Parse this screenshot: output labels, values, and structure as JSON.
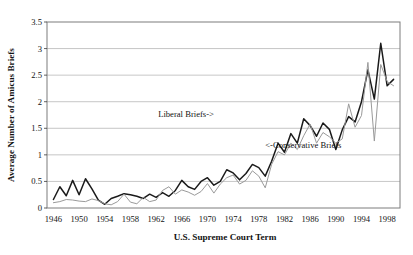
{
  "chart_data": {
    "type": "line",
    "title": "",
    "xlabel": "U.S. Supreme Court Term",
    "ylabel": "Average Number of Amicus Briefs",
    "xlim": [
      1945,
      2000
    ],
    "ylim": [
      0,
      3.5
    ],
    "ytick_labels": [
      "0",
      "0.5",
      "1",
      "1.5",
      "2",
      "2.5",
      "3",
      "3.5"
    ],
    "ytick_values": [
      0,
      0.5,
      1,
      1.5,
      2,
      2.5,
      3,
      3.5
    ],
    "xtick_labels": [
      "1946",
      "1950",
      "1954",
      "1958",
      "1962",
      "1966",
      "1970",
      "1974",
      "1978",
      "1982",
      "1986",
      "1990",
      "1994",
      "1998"
    ],
    "xtick_values": [
      1946,
      1950,
      1954,
      1958,
      1962,
      1966,
      1970,
      1974,
      1978,
      1982,
      1986,
      1990,
      1994,
      1998
    ],
    "grid": "horizontal",
    "legend_position": "inline-annotations",
    "annotations": [
      {
        "text": "Liberal Briefs->",
        "x": 1971,
        "y": 1.72
      },
      {
        "text": "<-Conservative Briefs",
        "x": 1979,
        "y": 1.13
      }
    ],
    "x": [
      1946,
      1947,
      1948,
      1949,
      1950,
      1951,
      1952,
      1953,
      1954,
      1955,
      1956,
      1957,
      1958,
      1959,
      1960,
      1961,
      1962,
      1963,
      1964,
      1965,
      1966,
      1967,
      1968,
      1969,
      1970,
      1971,
      1972,
      1973,
      1974,
      1975,
      1976,
      1977,
      1978,
      1979,
      1980,
      1981,
      1982,
      1983,
      1984,
      1985,
      1986,
      1987,
      1988,
      1989,
      1990,
      1991,
      1992,
      1993,
      1994,
      1995,
      1996,
      1997,
      1998,
      1999
    ],
    "series": [
      {
        "name": "Liberal Briefs",
        "color": "#1a1a1a",
        "values": [
          0.16,
          0.4,
          0.23,
          0.52,
          0.25,
          0.55,
          0.36,
          0.15,
          0.07,
          0.18,
          0.22,
          0.27,
          0.25,
          0.22,
          0.18,
          0.26,
          0.2,
          0.29,
          0.22,
          0.33,
          0.52,
          0.4,
          0.35,
          0.5,
          0.57,
          0.43,
          0.5,
          0.72,
          0.66,
          0.53,
          0.65,
          0.82,
          0.76,
          0.6,
          0.88,
          1.22,
          1.05,
          1.4,
          1.22,
          1.68,
          1.55,
          1.35,
          1.6,
          1.48,
          1.1,
          1.47,
          1.72,
          1.62,
          2.0,
          2.6,
          2.05,
          3.1,
          2.3,
          2.42
        ]
      },
      {
        "name": "Conservative Briefs",
        "color": "#9a9a9a",
        "values": [
          0.1,
          0.12,
          0.16,
          0.15,
          0.13,
          0.12,
          0.17,
          0.14,
          0.08,
          0.06,
          0.12,
          0.26,
          0.11,
          0.08,
          0.2,
          0.12,
          0.15,
          0.33,
          0.4,
          0.26,
          0.34,
          0.3,
          0.24,
          0.31,
          0.46,
          0.28,
          0.45,
          0.57,
          0.62,
          0.45,
          0.52,
          0.7,
          0.6,
          0.38,
          0.82,
          1.06,
          1.0,
          1.22,
          1.1,
          1.36,
          1.58,
          1.22,
          1.42,
          1.34,
          1.22,
          1.3,
          1.96,
          1.52,
          1.74,
          2.74,
          1.26,
          2.7,
          2.38,
          2.3
        ]
      }
    ]
  }
}
